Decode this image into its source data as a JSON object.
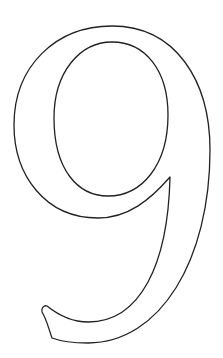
{
  "figure": {
    "glyph": "9",
    "style": "outline",
    "stroke_color": "#222222",
    "fill_color": "#ffffff",
    "background": "#ffffff"
  }
}
